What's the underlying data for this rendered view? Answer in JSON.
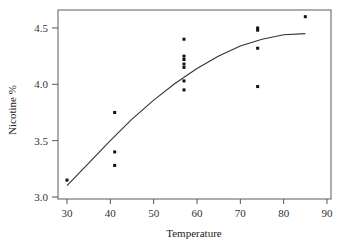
{
  "chart_data": {
    "type": "scatter",
    "title": "",
    "xlabel": "Temperature",
    "ylabel": "Nicotine %",
    "xlim": [
      28,
      92
    ],
    "ylim": [
      2.99,
      4.66
    ],
    "xticks": [
      30,
      40,
      50,
      60,
      70,
      80,
      90
    ],
    "yticks": [
      3.0,
      3.5,
      4.0,
      4.5
    ],
    "xtick_labels": [
      "30",
      "40",
      "50",
      "60",
      "70",
      "80",
      "90"
    ],
    "ytick_labels": [
      "3.0",
      "3.5",
      "4.0",
      "4.5"
    ],
    "grid": false,
    "legend": null,
    "series": [
      {
        "name": "observations",
        "kind": "scatter",
        "points": [
          [
            30,
            3.15
          ],
          [
            41,
            3.75
          ],
          [
            41,
            3.4
          ],
          [
            41,
            3.28
          ],
          [
            57,
            4.4
          ],
          [
            57,
            4.25
          ],
          [
            57,
            4.22
          ],
          [
            57,
            4.18
          ],
          [
            57,
            4.15
          ],
          [
            57,
            4.03
          ],
          [
            57,
            3.95
          ],
          [
            74,
            4.5
          ],
          [
            74,
            4.48
          ],
          [
            74,
            4.32
          ],
          [
            74,
            3.98
          ],
          [
            85,
            4.6
          ]
        ]
      },
      {
        "name": "fitted curve",
        "kind": "line",
        "points": [
          [
            30,
            3.1
          ],
          [
            35,
            3.3
          ],
          [
            40,
            3.5
          ],
          [
            45,
            3.69
          ],
          [
            50,
            3.86
          ],
          [
            55,
            4.01
          ],
          [
            60,
            4.14
          ],
          [
            65,
            4.25
          ],
          [
            70,
            4.34
          ],
          [
            75,
            4.4
          ],
          [
            80,
            4.44
          ],
          [
            85,
            4.45
          ]
        ]
      }
    ]
  }
}
